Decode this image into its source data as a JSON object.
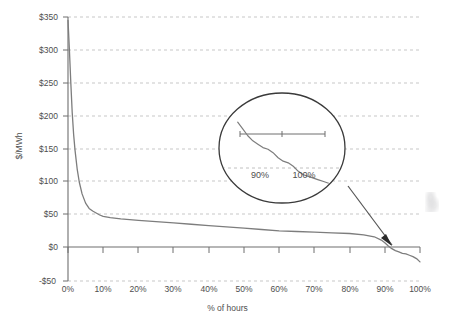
{
  "chart_data": {
    "type": "line",
    "title": "",
    "xlabel": "% of hours",
    "ylabel": "$/MWh",
    "xlim": [
      0,
      100
    ],
    "ylim": [
      -50,
      350
    ],
    "grid": true,
    "legend": false,
    "x_tick_labels": [
      "0%",
      "10%",
      "20%",
      "30%",
      "40%",
      "50%",
      "60%",
      "70%",
      "80%",
      "90%",
      "100%"
    ],
    "x_tick_values": [
      0,
      10,
      20,
      30,
      40,
      50,
      60,
      70,
      80,
      90,
      100
    ],
    "y_tick_labels": [
      "$350",
      "$300",
      "$250",
      "$200",
      "$150",
      "$100",
      "$50",
      "$0",
      "-$50"
    ],
    "y_tick_values": [
      350,
      300,
      250,
      200,
      150,
      100,
      50,
      0,
      -50
    ],
    "series": [
      {
        "name": "price duration curve",
        "color": "#7d7d7d",
        "x": [
          0,
          0.4,
          0.8,
          1.2,
          1.6,
          2,
          2.6,
          3.2,
          4,
          5,
          6,
          7,
          8,
          9,
          10,
          12,
          15,
          20,
          25,
          30,
          35,
          40,
          45,
          50,
          55,
          60,
          65,
          70,
          75,
          80,
          84,
          87,
          89,
          90,
          91,
          92,
          93,
          94,
          95,
          96,
          97,
          98,
          99,
          100
        ],
        "y": [
          345,
          300,
          250,
          205,
          172,
          148,
          120,
          100,
          82,
          68,
          60,
          56,
          53,
          50,
          48,
          46,
          44,
          42,
          40,
          38,
          36,
          34,
          32,
          30,
          28,
          26,
          25,
          24,
          23,
          22,
          20,
          17,
          12,
          8,
          3,
          -1,
          -4,
          -6,
          -8,
          -9,
          -11,
          -13,
          -16,
          -21
        ]
      }
    ],
    "annotations": [
      {
        "type": "magnifier-callout",
        "shape": "ellipse",
        "points_to": "90%-100% region of curve near zero crossing",
        "inset": {
          "x_tick_labels": [
            "90%",
            "100%"
          ],
          "zero_line": true,
          "series": [
            {
              "name": "price duration curve detail",
              "color": "#7d7d7d",
              "x": [
                89.2,
                89.8,
                90.4,
                91.0,
                91.6,
                92.2,
                92.8,
                93.4,
                94.0,
                94.6,
                95.2,
                95.8,
                96.4,
                97.0,
                97.6,
                98.2,
                98.8,
                99.4,
                100
              ],
              "y": [
                14,
                10,
                6,
                3,
                1,
                -1,
                -2,
                -4,
                -7,
                -9,
                -10,
                -12,
                -15,
                -17,
                -18,
                -19,
                -20,
                -21,
                -22
              ]
            }
          ]
        }
      }
    ],
    "colors": {
      "curve": "#7d7d7d",
      "axis": "#6e6e6e",
      "gridline": "#b9b9b9",
      "text": "#4e4e4e",
      "arrow": "#555555",
      "background": "#ffffff"
    }
  }
}
